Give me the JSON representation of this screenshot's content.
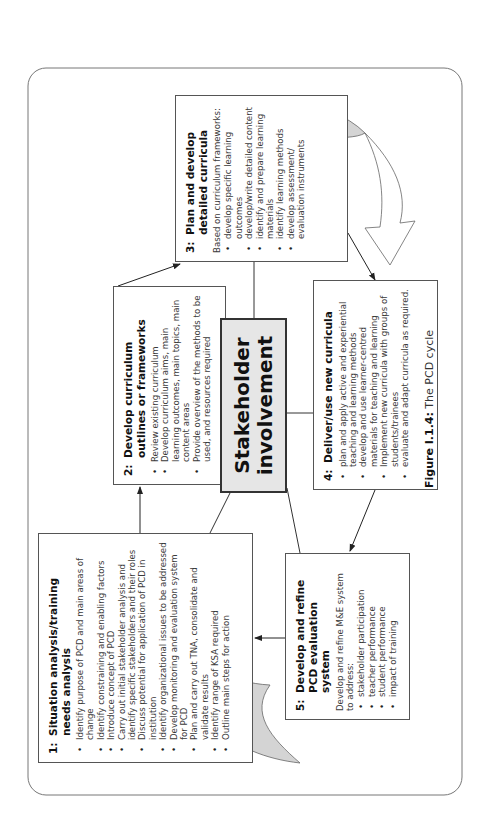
{
  "figure": {
    "caption_label": "Figure I.1.4:",
    "caption_text": " The PCD cycle",
    "colors": {
      "border": "#555555",
      "center_fill": "#e6e6e6",
      "arrow_fill": "#d4d4d4",
      "text": "#2a2a2a"
    }
  },
  "center": {
    "line1": "Stakeholder",
    "line2": "involvement"
  },
  "boxes": {
    "b1": {
      "num": "1:",
      "title": "Situation analysis/training needs analysis",
      "items": [
        "Identify purpose of PCD and main areas of change",
        "Identify constraining and enabling factors",
        "Introduce concept of PCD",
        "Carry out initial stakeholder analysis and identify specific stakeholders and their roles",
        "Discuss potential for application of PCD in institution",
        "Identify organizational issues to be addressed",
        "Develop monitoring and evaluation system for PCD",
        "Plan and carry out TNA, consolidate and validate results",
        "Identify range of KSA required",
        "Outline main steps for action"
      ]
    },
    "b2": {
      "num": "2:",
      "title": "Develop curriculum outlines or frameworks",
      "items": [
        "Review existing curriculum",
        "Develop curriculum aims, main learning outcomes, main topics, main content areas",
        "Provide overview of the methods to be used, and resources required"
      ]
    },
    "b3": {
      "num": "3:",
      "title": "Plan and develop detailed curricula",
      "intro": "Based on curriculum frameworks:",
      "items": [
        "develop specific learning outcomes",
        "develop/write detailed content",
        "identify and prepare learning materials",
        "identify learning methods",
        "develop assessment/ evaluation instruments"
      ]
    },
    "b4": {
      "num": "4:",
      "title": "Deliver/use new curricula",
      "items": [
        "plan and apply active and experiential teaching and learning methods",
        "develop and use learner-centred materials for teaching and learning",
        "Implement new curricula with groups of students/trainees",
        "evaluate and adapt curricula as required."
      ]
    },
    "b5": {
      "num": "5:",
      "title": "Develop and refine PCD evaluation system",
      "intro": "Develop and refine M&E system to address:",
      "items": [
        "stakeholder participation",
        "teacher performance",
        "student performance",
        "impact of training"
      ]
    }
  }
}
